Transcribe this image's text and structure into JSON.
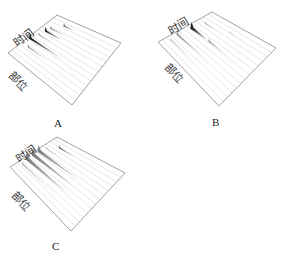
{
  "figure": {
    "panels": [
      {
        "id": "A",
        "label": "A",
        "time_axis_label": "时间",
        "position_axis_label": "部位",
        "frame": {
          "top": [
            57,
            15
          ],
          "left": [
            8,
            53
          ],
          "bottom": [
            72,
            105
          ],
          "right": [
            121,
            43
          ]
        },
        "label_pos": [
          54,
          118
        ],
        "time_label_pos": [
          12,
          40
        ],
        "time_label_rot": -37,
        "pos_label_pos": [
          14,
          70
        ],
        "pos_label_rot": 45,
        "lines": 12,
        "peaks": [
          {
            "t": 0.1,
            "p": 0.28,
            "len": 0.35,
            "w": 1.6,
            "dark": 0.55
          },
          {
            "t": 0.02,
            "p": 0.42,
            "len": 0.55,
            "w": 3.2,
            "dark": 0.95
          },
          {
            "t": 0.06,
            "p": 0.55,
            "len": 0.25,
            "w": 1.4,
            "dark": 0.5
          },
          {
            "t": 0.08,
            "p": 0.66,
            "len": 0.3,
            "w": 2.6,
            "dark": 0.9
          },
          {
            "t": 0.1,
            "p": 0.74,
            "len": 0.3,
            "w": 1.4,
            "dark": 0.6
          },
          {
            "t": 0.2,
            "p": 0.88,
            "len": 0.2,
            "w": 1.6,
            "dark": 0.8
          }
        ]
      },
      {
        "id": "B",
        "label": "B",
        "time_axis_label": "时间",
        "position_axis_label": "部位",
        "frame": {
          "top": [
            212,
            12
          ],
          "left": [
            158,
            42
          ],
          "bottom": [
            219,
            106
          ],
          "right": [
            276,
            48
          ]
        },
        "label_pos": [
          212,
          117
        ],
        "time_label_pos": [
          166,
          27
        ],
        "time_label_rot": -30,
        "pos_label_pos": [
          170,
          62
        ],
        "pos_label_rot": 45,
        "lines": 12,
        "peaks": [
          {
            "t": 0.05,
            "p": 0.18,
            "len": 0.45,
            "w": 1.2,
            "dark": 0.3
          },
          {
            "t": 0.03,
            "p": 0.32,
            "len": 0.5,
            "w": 2.0,
            "dark": 0.45
          },
          {
            "t": 0.05,
            "p": 0.56,
            "len": 0.28,
            "w": 3.6,
            "dark": 0.95
          },
          {
            "t": 0.33,
            "p": 0.56,
            "len": 0.3,
            "w": 1.8,
            "dark": 0.45
          },
          {
            "t": 0.1,
            "p": 0.76,
            "len": 0.2,
            "w": 1.2,
            "dark": 0.4
          },
          {
            "t": 0.4,
            "p": 0.86,
            "len": 0.15,
            "w": 1.0,
            "dark": 0.3
          }
        ]
      },
      {
        "id": "C",
        "label": "C",
        "time_axis_label": "时间",
        "position_axis_label": "部位",
        "frame": {
          "top": [
            57,
            137
          ],
          "left": [
            10,
            167
          ],
          "bottom": [
            71,
            231
          ],
          "right": [
            125,
            173
          ]
        },
        "label_pos": [
          52,
          241
        ],
        "time_label_pos": [
          14,
          155
        ],
        "time_label_rot": -33,
        "pos_label_pos": [
          17,
          190
        ],
        "pos_label_rot": 45,
        "lines": 12,
        "peaks": [
          {
            "t": 0.05,
            "p": 0.2,
            "len": 0.55,
            "w": 1.6,
            "dark": 0.35
          },
          {
            "t": 0.02,
            "p": 0.33,
            "len": 0.7,
            "w": 4.2,
            "dark": 0.55
          },
          {
            "t": 0.02,
            "p": 0.46,
            "len": 0.7,
            "w": 4.0,
            "dark": 0.55
          },
          {
            "t": 0.02,
            "p": 0.58,
            "len": 0.7,
            "w": 3.6,
            "dark": 0.55
          },
          {
            "t": 0.05,
            "p": 0.7,
            "len": 0.3,
            "w": 1.2,
            "dark": 0.35
          },
          {
            "t": 0.15,
            "p": 0.84,
            "len": 0.25,
            "w": 1.6,
            "dark": 0.75
          }
        ]
      }
    ]
  },
  "colors": {
    "frame": "#8a8a8a",
    "grid_line": "#d6d6d6",
    "peak": "#111111",
    "text": "#222222"
  }
}
